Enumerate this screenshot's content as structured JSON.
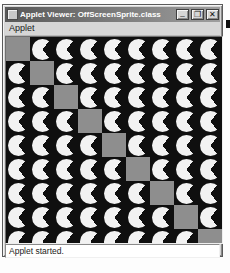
{
  "window": {
    "title": "Applet Viewer: OffScreenSprite.class",
    "buttons": {
      "minimize": "_",
      "maximize": "❐",
      "close": "✕"
    },
    "menu_items": [
      {
        "label": "Applet"
      }
    ],
    "status_text": "Applet started."
  },
  "applet": {
    "bg_color": "#0f0f0f",
    "sprite_color": "#f2f2f2",
    "square_color": "#8e8e8e",
    "grid": {
      "cols": 9,
      "rows": 9,
      "cell_w": 24,
      "cell_h": 24,
      "circle_d": 21,
      "mouth_deg": 106,
      "canvas_w": 216,
      "canvas_h": 206
    },
    "gray_cells": [
      [
        0,
        0
      ],
      [
        1,
        1
      ],
      [
        2,
        2
      ],
      [
        3,
        3
      ],
      [
        4,
        4
      ],
      [
        5,
        5
      ],
      [
        6,
        6
      ],
      [
        7,
        7
      ],
      [
        8,
        8
      ]
    ]
  },
  "colors": {
    "titlebar_from": "#585858",
    "titlebar_to": "#9e9e9e",
    "title_text": "#ffffff",
    "chrome": "#d4d4d4"
  }
}
